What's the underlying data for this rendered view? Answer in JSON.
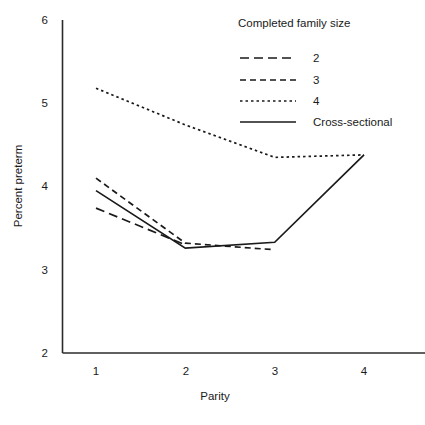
{
  "chart_data": {
    "type": "line",
    "title": "",
    "xlabel": "Parity",
    "ylabel": "Percent preterm",
    "x": [
      1,
      2,
      3,
      4
    ],
    "xticklabels": [
      "1",
      "2",
      "3",
      "4"
    ],
    "yticklabels": [
      "2",
      "3",
      "4",
      "5",
      "6"
    ],
    "yticks": [
      2,
      3,
      4,
      5,
      6
    ],
    "xlim": [
      0.72,
      4.3
    ],
    "ylim": [
      2,
      6
    ],
    "grid": false,
    "legend_position": "top-right",
    "legend_title": "Completed family size",
    "series": [
      {
        "name": "2",
        "label": "2",
        "style": "long-dash",
        "dasharray": "9,5",
        "x": [
          1,
          2
        ],
        "values": [
          3.74,
          3.3
        ]
      },
      {
        "name": "3",
        "label": "3",
        "style": "medium-dash",
        "dasharray": "6,4",
        "x": [
          1,
          2,
          3
        ],
        "values": [
          4.1,
          3.32,
          3.24
        ]
      },
      {
        "name": "4",
        "label": "4",
        "style": "dotted",
        "dasharray": "2.5,3",
        "x": [
          1,
          2,
          3,
          4
        ],
        "values": [
          5.18,
          4.74,
          4.35,
          4.38
        ]
      },
      {
        "name": "Cross-sectional",
        "label": "Cross-sectional",
        "style": "solid",
        "dasharray": "none",
        "x": [
          1,
          2,
          3,
          4
        ],
        "values": [
          3.95,
          3.26,
          3.33,
          4.38
        ]
      }
    ]
  },
  "colors": {
    "line": "#1a1a1a",
    "axis": "#2b2b2b",
    "background": "#ffffff"
  }
}
